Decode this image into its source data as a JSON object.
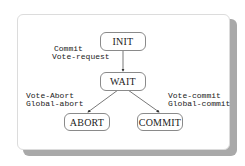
{
  "diagram": {
    "type": "state-machine",
    "title": "",
    "states": [
      {
        "id": "init",
        "label": "INIT"
      },
      {
        "id": "wait",
        "label": "WAIT"
      },
      {
        "id": "abort",
        "label": "ABORT"
      },
      {
        "id": "commit",
        "label": "COMMIT"
      }
    ],
    "transitions": [
      {
        "from": "init",
        "to": "wait",
        "condition": "Commit",
        "action": "Vote-request"
      },
      {
        "from": "wait",
        "to": "abort",
        "condition": "Vote-Abort",
        "action": "Global-abort"
      },
      {
        "from": "wait",
        "to": "commit",
        "condition": "Vote-commit",
        "action": "Global-commit"
      }
    ]
  },
  "colors": {
    "line": "#555555",
    "box_border": "#8a8a8a",
    "shadow": "#a9a9a9",
    "text": "#222222"
  }
}
